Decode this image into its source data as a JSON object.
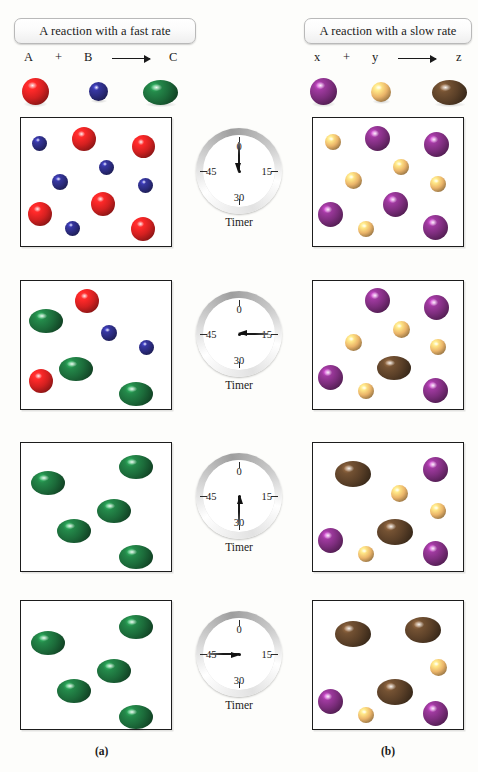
{
  "figure": {
    "panels": [
      {
        "id": "a",
        "caption": "(a)",
        "title": "A reaction with a fast rate"
      },
      {
        "id": "b",
        "caption": "(b)",
        "title": "A reaction with a slow rate"
      }
    ],
    "timer_label": "Timer",
    "timer_ticks": [
      "0",
      "15",
      "30",
      "45"
    ]
  },
  "equations": {
    "left": {
      "reactant1": "A",
      "plus": "+",
      "reactant2": "B",
      "arrow": "⟶",
      "product": "C"
    },
    "right": {
      "reactant1": "x",
      "plus": "+",
      "reactant2": "y",
      "arrow": "⟶",
      "product": "z"
    }
  },
  "colors": {
    "A_red": "#d32020",
    "B_blue": "#2b2b7e",
    "C_green": "#1c6b3a",
    "x_purple": "#7d2d7d",
    "y_orange": "#eab469",
    "z_brown": "#5b4028",
    "box_border": "#1d1d1d",
    "page_background": "#fdfdfb"
  },
  "legend": {
    "left": [
      {
        "label": "A",
        "color": "#d32020",
        "shape": "sphere"
      },
      {
        "label": "B",
        "color": "#2b2b7e",
        "shape": "sphere"
      },
      {
        "label": "C",
        "color": "#1c6b3a",
        "shape": "ellipse"
      }
    ],
    "right": [
      {
        "label": "x",
        "color": "#7d2d7d",
        "shape": "sphere"
      },
      {
        "label": "y",
        "color": "#eab469",
        "shape": "sphere"
      },
      {
        "label": "z",
        "color": "#5b4028",
        "shape": "ellipse"
      }
    ]
  },
  "chart_data": {
    "type": "diagram",
    "xlabel": "Elapsed time on timer (seconds)",
    "ylabel": "Species present in reaction vessel",
    "timer_readings": [
      0,
      15,
      30,
      45
    ],
    "series": [
      {
        "name": "A (red reactant)",
        "panel": "a",
        "color": "#d32020",
        "values": [
          5,
          2,
          0,
          0
        ]
      },
      {
        "name": "B (blue reactant)",
        "panel": "a",
        "color": "#2b2b7e",
        "values": [
          5,
          2,
          0,
          0
        ]
      },
      {
        "name": "C (green product)",
        "panel": "a",
        "color": "#1c6b3a",
        "values": [
          0,
          3,
          5,
          5
        ]
      },
      {
        "name": "x (purple reactant)",
        "panel": "b",
        "color": "#7d2d7d",
        "values": [
          5,
          4,
          3,
          2
        ]
      },
      {
        "name": "y (orange reactant)",
        "panel": "b",
        "color": "#eab469",
        "values": [
          5,
          4,
          3,
          2
        ]
      },
      {
        "name": "z (brown product)",
        "panel": "b",
        "color": "#5b4028",
        "values": [
          0,
          1,
          2,
          3
        ]
      }
    ]
  },
  "frames": [
    {
      "timer": 0,
      "hand_angle_deg": -90,
      "left_molecules": [
        {
          "c": "#2b2b7e",
          "x": 11,
          "y": 18,
          "w": 15,
          "h": 15,
          "shape": "sphere"
        },
        {
          "c": "#d32020",
          "x": 51,
          "y": 9,
          "w": 24,
          "h": 24,
          "shape": "sphere"
        },
        {
          "c": "#d32020",
          "x": 111,
          "y": 17,
          "w": 23,
          "h": 23,
          "shape": "sphere"
        },
        {
          "c": "#2b2b7e",
          "x": 78,
          "y": 42,
          "w": 15,
          "h": 15,
          "shape": "sphere"
        },
        {
          "c": "#2b2b7e",
          "x": 31,
          "y": 56,
          "w": 16,
          "h": 16,
          "shape": "sphere"
        },
        {
          "c": "#2b2b7e",
          "x": 117,
          "y": 60,
          "w": 15,
          "h": 15,
          "shape": "sphere"
        },
        {
          "c": "#d32020",
          "x": 70,
          "y": 74,
          "w": 24,
          "h": 24,
          "shape": "sphere"
        },
        {
          "c": "#d32020",
          "x": 7,
          "y": 84,
          "w": 24,
          "h": 24,
          "shape": "sphere"
        },
        {
          "c": "#d32020",
          "x": 110,
          "y": 99,
          "w": 24,
          "h": 24,
          "shape": "sphere"
        },
        {
          "c": "#2b2b7e",
          "x": 44,
          "y": 103,
          "w": 15,
          "h": 15,
          "shape": "sphere"
        }
      ],
      "right_molecules": [
        {
          "c": "#eab469",
          "x": 12,
          "y": 16,
          "w": 16,
          "h": 16,
          "shape": "sphere"
        },
        {
          "c": "#7d2d7d",
          "x": 52,
          "y": 8,
          "w": 25,
          "h": 25,
          "shape": "sphere"
        },
        {
          "c": "#7d2d7d",
          "x": 111,
          "y": 14,
          "w": 25,
          "h": 25,
          "shape": "sphere"
        },
        {
          "c": "#eab469",
          "x": 80,
          "y": 41,
          "w": 16,
          "h": 16,
          "shape": "sphere"
        },
        {
          "c": "#eab469",
          "x": 32,
          "y": 54,
          "w": 17,
          "h": 17,
          "shape": "sphere"
        },
        {
          "c": "#eab469",
          "x": 117,
          "y": 58,
          "w": 16,
          "h": 16,
          "shape": "sphere"
        },
        {
          "c": "#7d2d7d",
          "x": 70,
          "y": 74,
          "w": 25,
          "h": 25,
          "shape": "sphere"
        },
        {
          "c": "#7d2d7d",
          "x": 5,
          "y": 84,
          "w": 25,
          "h": 25,
          "shape": "sphere"
        },
        {
          "c": "#7d2d7d",
          "x": 110,
          "y": 97,
          "w": 25,
          "h": 25,
          "shape": "sphere"
        },
        {
          "c": "#eab469",
          "x": 45,
          "y": 103,
          "w": 16,
          "h": 16,
          "shape": "sphere"
        }
      ]
    },
    {
      "timer": 15,
      "hand_angle_deg": 0,
      "left_molecules": [
        {
          "c": "#d32020",
          "x": 54,
          "y": 8,
          "w": 24,
          "h": 24,
          "shape": "sphere"
        },
        {
          "c": "#1c6b3a",
          "x": 8,
          "y": 28,
          "w": 34,
          "h": 24,
          "shape": "ellipse"
        },
        {
          "c": "#2b2b7e",
          "x": 80,
          "y": 44,
          "w": 16,
          "h": 16,
          "shape": "sphere"
        },
        {
          "c": "#2b2b7e",
          "x": 118,
          "y": 59,
          "w": 15,
          "h": 15,
          "shape": "sphere"
        },
        {
          "c": "#1c6b3a",
          "x": 38,
          "y": 76,
          "w": 34,
          "h": 24,
          "shape": "ellipse"
        },
        {
          "c": "#d32020",
          "x": 8,
          "y": 88,
          "w": 24,
          "h": 24,
          "shape": "sphere"
        },
        {
          "c": "#1c6b3a",
          "x": 98,
          "y": 101,
          "w": 34,
          "h": 24,
          "shape": "ellipse"
        }
      ],
      "right_molecules": [
        {
          "c": "#7d2d7d",
          "x": 52,
          "y": 7,
          "w": 25,
          "h": 25,
          "shape": "sphere"
        },
        {
          "c": "#7d2d7d",
          "x": 111,
          "y": 14,
          "w": 25,
          "h": 25,
          "shape": "sphere"
        },
        {
          "c": "#eab469",
          "x": 80,
          "y": 40,
          "w": 17,
          "h": 17,
          "shape": "sphere"
        },
        {
          "c": "#eab469",
          "x": 32,
          "y": 53,
          "w": 17,
          "h": 17,
          "shape": "sphere"
        },
        {
          "c": "#eab469",
          "x": 117,
          "y": 58,
          "w": 16,
          "h": 16,
          "shape": "sphere"
        },
        {
          "c": "#5b4028",
          "x": 64,
          "y": 75,
          "w": 34,
          "h": 24,
          "shape": "ellipse"
        },
        {
          "c": "#7d2d7d",
          "x": 5,
          "y": 84,
          "w": 25,
          "h": 25,
          "shape": "sphere"
        },
        {
          "c": "#7d2d7d",
          "x": 110,
          "y": 97,
          "w": 25,
          "h": 25,
          "shape": "sphere"
        },
        {
          "c": "#eab469",
          "x": 45,
          "y": 102,
          "w": 16,
          "h": 16,
          "shape": "sphere"
        }
      ]
    },
    {
      "timer": 30,
      "hand_angle_deg": 90,
      "left_molecules": [
        {
          "c": "#1c6b3a",
          "x": 98,
          "y": 12,
          "w": 34,
          "h": 24,
          "shape": "ellipse"
        },
        {
          "c": "#1c6b3a",
          "x": 10,
          "y": 28,
          "w": 34,
          "h": 24,
          "shape": "ellipse"
        },
        {
          "c": "#1c6b3a",
          "x": 76,
          "y": 56,
          "w": 34,
          "h": 24,
          "shape": "ellipse"
        },
        {
          "c": "#1c6b3a",
          "x": 36,
          "y": 76,
          "w": 34,
          "h": 24,
          "shape": "ellipse"
        },
        {
          "c": "#1c6b3a",
          "x": 98,
          "y": 102,
          "w": 34,
          "h": 24,
          "shape": "ellipse"
        }
      ],
      "right_molecules": [
        {
          "c": "#5b4028",
          "x": 22,
          "y": 18,
          "w": 36,
          "h": 26,
          "shape": "ellipse"
        },
        {
          "c": "#7d2d7d",
          "x": 110,
          "y": 14,
          "w": 25,
          "h": 25,
          "shape": "sphere"
        },
        {
          "c": "#eab469",
          "x": 78,
          "y": 42,
          "w": 17,
          "h": 17,
          "shape": "sphere"
        },
        {
          "c": "#eab469",
          "x": 117,
          "y": 60,
          "w": 16,
          "h": 16,
          "shape": "sphere"
        },
        {
          "c": "#5b4028",
          "x": 64,
          "y": 76,
          "w": 36,
          "h": 26,
          "shape": "ellipse"
        },
        {
          "c": "#7d2d7d",
          "x": 5,
          "y": 85,
          "w": 25,
          "h": 25,
          "shape": "sphere"
        },
        {
          "c": "#7d2d7d",
          "x": 110,
          "y": 98,
          "w": 25,
          "h": 25,
          "shape": "sphere"
        },
        {
          "c": "#eab469",
          "x": 45,
          "y": 103,
          "w": 16,
          "h": 16,
          "shape": "sphere"
        }
      ]
    },
    {
      "timer": 45,
      "hand_angle_deg": 180,
      "left_molecules": [
        {
          "c": "#1c6b3a",
          "x": 98,
          "y": 14,
          "w": 34,
          "h": 24,
          "shape": "ellipse"
        },
        {
          "c": "#1c6b3a",
          "x": 10,
          "y": 30,
          "w": 34,
          "h": 24,
          "shape": "ellipse"
        },
        {
          "c": "#1c6b3a",
          "x": 76,
          "y": 58,
          "w": 34,
          "h": 24,
          "shape": "ellipse"
        },
        {
          "c": "#1c6b3a",
          "x": 36,
          "y": 78,
          "w": 34,
          "h": 24,
          "shape": "ellipse"
        },
        {
          "c": "#1c6b3a",
          "x": 98,
          "y": 104,
          "w": 34,
          "h": 24,
          "shape": "ellipse"
        }
      ],
      "right_molecules": [
        {
          "c": "#5b4028",
          "x": 22,
          "y": 20,
          "w": 36,
          "h": 26,
          "shape": "ellipse"
        },
        {
          "c": "#5b4028",
          "x": 92,
          "y": 16,
          "w": 36,
          "h": 26,
          "shape": "ellipse"
        },
        {
          "c": "#eab469",
          "x": 117,
          "y": 58,
          "w": 17,
          "h": 17,
          "shape": "sphere"
        },
        {
          "c": "#5b4028",
          "x": 64,
          "y": 78,
          "w": 36,
          "h": 26,
          "shape": "ellipse"
        },
        {
          "c": "#7d2d7d",
          "x": 5,
          "y": 88,
          "w": 25,
          "h": 25,
          "shape": "sphere"
        },
        {
          "c": "#7d2d7d",
          "x": 110,
          "y": 100,
          "w": 25,
          "h": 25,
          "shape": "sphere"
        },
        {
          "c": "#eab469",
          "x": 45,
          "y": 106,
          "w": 16,
          "h": 16,
          "shape": "sphere"
        }
      ]
    }
  ]
}
